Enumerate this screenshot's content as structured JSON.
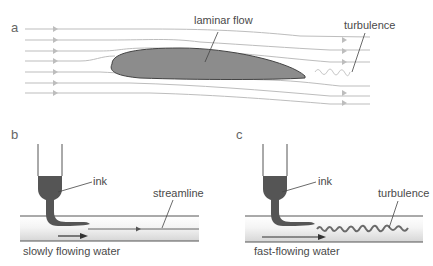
{
  "panels": {
    "a": {
      "letter": "a",
      "labels": {
        "laminar": "laminar flow",
        "turbulence": "turbulence"
      }
    },
    "b": {
      "letter": "b",
      "labels": {
        "ink": "ink",
        "streamline": "streamline",
        "caption": "slowly flowing water"
      }
    },
    "c": {
      "letter": "c",
      "labels": {
        "ink": "ink",
        "turbulence": "turbulence",
        "caption": "fast-flowing water"
      }
    }
  },
  "colors": {
    "line": "#b8b8b8",
    "airfoil_fill": "#8c8c8c",
    "airfoil_stroke": "#444444",
    "ink": "#555555",
    "pipe_wall": "#555555",
    "text": "#4a4a4a"
  }
}
